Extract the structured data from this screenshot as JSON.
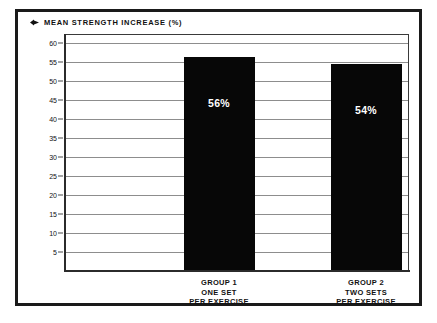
{
  "chart_data": {
    "type": "bar",
    "title": "MEAN STRENGTH INCREASE (%)",
    "title_marker_icon": "diamond-marker-icon",
    "xlabel": "",
    "ylabel": "",
    "ylim": [
      0,
      62
    ],
    "yticks": [
      60,
      55,
      50,
      45,
      40,
      35,
      30,
      25,
      20,
      15,
      10,
      5
    ],
    "grid": true,
    "legend": "none",
    "categories": [
      "GROUP 1 ONE SET PER EXERCISE",
      "GROUP 2 TWO SETS PER EXERCISE"
    ],
    "category_lines": [
      [
        "GROUP 1",
        "ONE SET",
        "PER EXERCISE"
      ],
      [
        "GROUP 2",
        "TWO SETS",
        "PER EXERCISE"
      ]
    ],
    "values": [
      56,
      54
    ],
    "value_labels": [
      "56%",
      "54%"
    ],
    "bar_color": "#070707",
    "value_label_color": "#ffffff",
    "gridline_color": "#8d8d8d",
    "axis_color": "#2b2b2b",
    "background_color": "#ffffff",
    "border_color": "#1a1a1a"
  }
}
